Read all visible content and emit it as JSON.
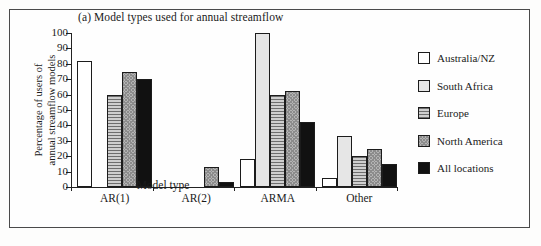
{
  "chart_data": {
    "type": "bar",
    "title": "(a)   Model types used for annual streamflow",
    "xlabel": "Model type",
    "ylabel_lines": [
      "Percentage of users of",
      "annual streamflow models"
    ],
    "ylabel": "Percentage of users of annual streamflow models",
    "categories": [
      "AR(1)",
      "AR(2)",
      "ARMA",
      "Other"
    ],
    "ylim": [
      0,
      100
    ],
    "yticks": [
      0,
      10,
      20,
      30,
      40,
      50,
      60,
      70,
      80,
      90,
      100
    ],
    "ytick_labels": [
      "0",
      "10",
      "20",
      "30",
      "40",
      "50",
      "60",
      "70",
      "80",
      "90",
      "100"
    ],
    "grid": false,
    "legend_position": "right",
    "series": [
      {
        "name": "Australia/NZ",
        "fill": "f-white",
        "values": [
          82,
          0,
          18,
          6
        ]
      },
      {
        "name": "South Africa",
        "fill": "f-light",
        "values": [
          0,
          0,
          100,
          33
        ]
      },
      {
        "name": "Europe",
        "fill": "f-hlines",
        "values": [
          59.5,
          0,
          59.5,
          20
        ]
      },
      {
        "name": "North America",
        "fill": "f-checker",
        "values": [
          75,
          13,
          62.5,
          25
        ]
      },
      {
        "name": "All locations",
        "fill": "f-black",
        "values": [
          70,
          3,
          42,
          15
        ]
      }
    ]
  },
  "legend": {
    "items": [
      {
        "label": "Australia/NZ",
        "fill": "f-white"
      },
      {
        "label": "South Africa",
        "fill": "f-light"
      },
      {
        "label": "Europe",
        "fill": "f-hlines"
      },
      {
        "label": "North America",
        "fill": "f-checker"
      },
      {
        "label": "All locations",
        "fill": "f-black"
      }
    ]
  }
}
